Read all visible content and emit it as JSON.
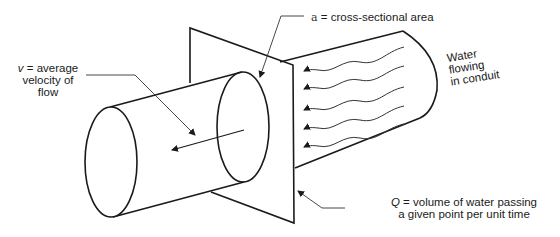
{
  "diagram": {
    "type": "conduit-flow-schematic",
    "labels": {
      "velocity": {
        "symbol": "v",
        "line1_rest": " = average",
        "line2": "velocity of",
        "line3": "flow"
      },
      "area": {
        "symbol": "a",
        "rest": " = cross-sectional area"
      },
      "water": {
        "line1": "Water",
        "line2": "flowing",
        "line3": "in conduit"
      },
      "discharge": {
        "symbol": "Q",
        "line1_rest": " = volume of water passing",
        "line2": "a given point per unit time"
      }
    },
    "flow_arrow_count": 5,
    "colors": {
      "stroke": "#1a1a1a",
      "background": "#ffffff"
    }
  }
}
